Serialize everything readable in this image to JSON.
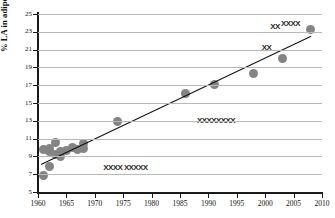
{
  "chart_data": {
    "type": "scatter",
    "title": "",
    "xlabel": "",
    "ylabel": "% LA in adipose fat",
    "xlim": [
      1960,
      2010
    ],
    "ylim": [
      5,
      25
    ],
    "grid": true,
    "legend": "none",
    "x_ticks": [
      "1960",
      "1965",
      "1970",
      "1975",
      "1980",
      "1985",
      "1990",
      "1995",
      "2000",
      "2005",
      "2010"
    ],
    "y_ticks": [
      "5",
      "7",
      "9",
      "11",
      "13",
      "15",
      "17",
      "19",
      "21",
      "23",
      "25"
    ],
    "marker_color": "#848484",
    "trendline_color": "#111111",
    "gridline_color": "#b9b9b9",
    "series": [
      {
        "name": "% LA in adipose fat",
        "points": [
          {
            "x": 1961,
            "y": 9.8
          },
          {
            "x": 1961,
            "y": 6.8
          },
          {
            "x": 1962,
            "y": 9.9
          },
          {
            "x": 1962,
            "y": 9.6
          },
          {
            "x": 1962,
            "y": 7.9
          },
          {
            "x": 1963,
            "y": 10.6
          },
          {
            "x": 1963,
            "y": 9.2
          },
          {
            "x": 1964,
            "y": 9.0
          },
          {
            "x": 1964,
            "y": 9.5
          },
          {
            "x": 1965,
            "y": 9.7
          },
          {
            "x": 1966,
            "y": 10.0
          },
          {
            "x": 1967,
            "y": 9.8
          },
          {
            "x": 1968,
            "y": 10.5
          },
          {
            "x": 1968,
            "y": 9.9
          },
          {
            "x": 1974,
            "y": 12.9
          },
          {
            "x": 1986,
            "y": 16.1
          },
          {
            "x": 1991,
            "y": 17.1
          },
          {
            "x": 1998,
            "y": 18.3
          },
          {
            "x": 2003,
            "y": 20.0
          },
          {
            "x": 2008,
            "y": 23.3
          }
        ]
      }
    ],
    "trendline": {
      "x1": 1960.5,
      "y1": 8.2,
      "x2": 2008.0,
      "y2": 22.6
    }
  },
  "artifacts": {
    "marks": [
      {
        "text": "XXXX  XXXXX",
        "x": 1971.5,
        "y": 7.7
      },
      {
        "text": "XXXXXXXX",
        "x": 1988.0,
        "y": 13.0
      },
      {
        "text": "XX",
        "x": 1999.4,
        "y": 21.2
      },
      {
        "text": "XX",
        "x": 2000.9,
        "y": 23.5
      },
      {
        "text": "XXXX",
        "x": 2002.8,
        "y": 23.9
      }
    ]
  }
}
